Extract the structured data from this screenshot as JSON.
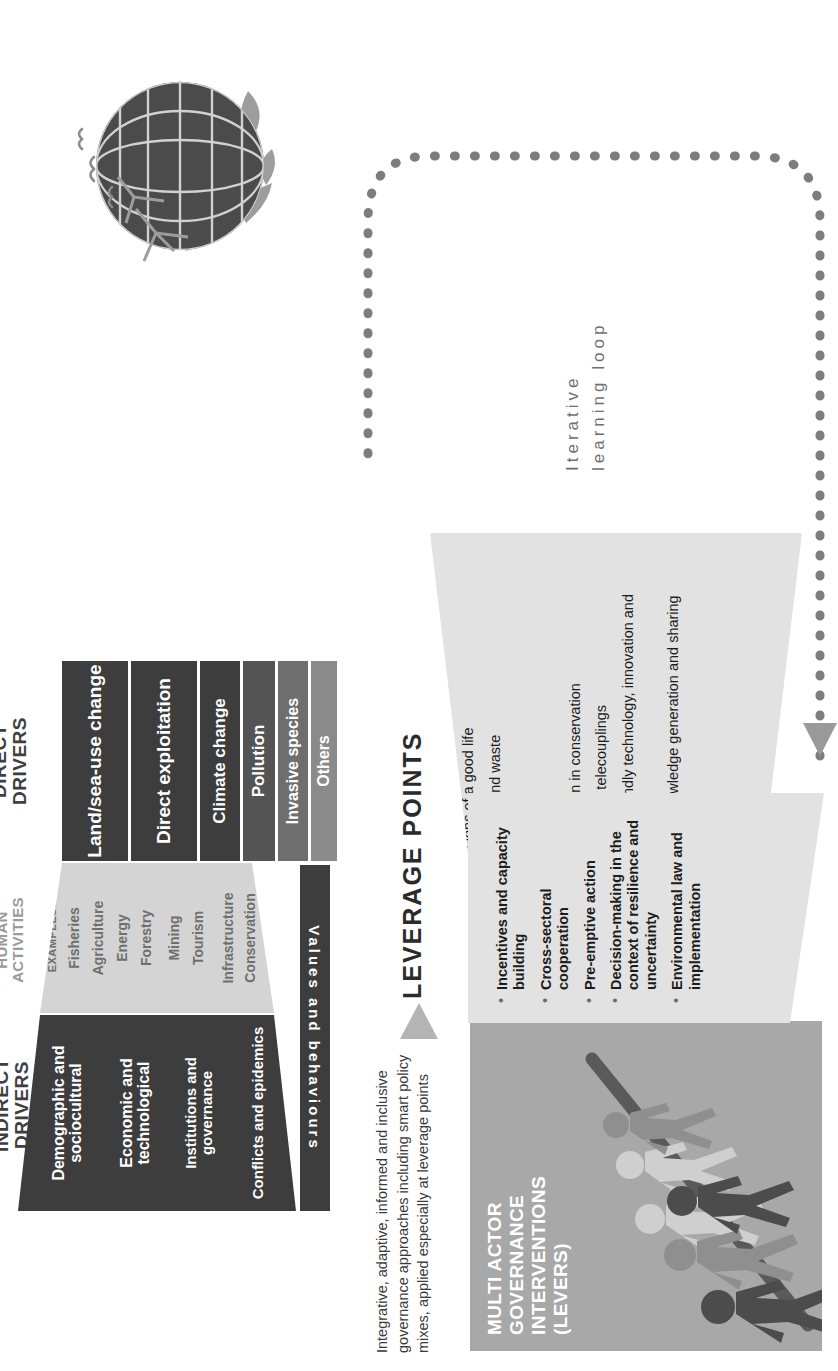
{
  "figure": {
    "title_hidden": "IPBES nature futures drivers and leverage points diagram"
  },
  "headers": {
    "indirect_drivers": "INDIRECT\nDRIVERS",
    "indirect_drivers_line1": "INDIRECT",
    "indirect_drivers_line2": "DRIVERS",
    "human_activities_line1": "HUMAN",
    "human_activities_line2": "ACTIVITIES",
    "direct_drivers_line1": "DIRECT",
    "direct_drivers_line2": "DRIVERS"
  },
  "indirect_drivers": [
    "Demographic and sociocultural",
    "Economic and technological",
    "Institutions and governance",
    "Conflicts and epidemics"
  ],
  "human_activities": {
    "label": "EXAMPLES:",
    "items": [
      "Fisheries",
      "Agriculture",
      "Energy",
      "Forestry",
      "Mining",
      "Tourism",
      "Infrastructure",
      "Conservation",
      "etc."
    ]
  },
  "direct_drivers": [
    "Land/sea-use change",
    "Direct exploitation",
    "Climate change",
    "Pollution",
    "Invasive species",
    "Others"
  ],
  "values_bar": "Values and behaviours",
  "leverage": {
    "title": "LEVERAGE POINTS",
    "points": [
      {
        "lead": "Embrace",
        "rest": " diverse visions of a good life"
      },
      {
        "lead": "Reduce",
        "rest": " total consumption and waste"
      },
      {
        "lead": "Unleash",
        "rest": " values and action"
      },
      {
        "lead": "Reduce",
        "rest": " inequalities"
      },
      {
        "lead": "Practice",
        "rest": " justice and inclusion in conservation"
      },
      {
        "lead": "Internalize",
        "rest": " externalities and telecouplings"
      },
      {
        "lead": "Ensure",
        "rest": " environmentally friendly technology, innovation and investment"
      },
      {
        "lead": "Promote",
        "rest": " education and knowledge generation and sharing"
      }
    ]
  },
  "levers": {
    "title_line1": "MULTI ACTOR",
    "title_line2": "GOVERNANCE INTERVENTIONS",
    "title_line3": "(LEVERS)",
    "items": [
      "Incentives and capacity building",
      "Cross-sectoral cooperation",
      "Pre-emptive action",
      "Decision-making in the context of resilience and uncertainty",
      "Environmental law and implementation"
    ]
  },
  "caption": "Integrative, adaptive, informed and inclusive governance approaches including smart policy mixes, applied especially at leverage points",
  "loop_label_line1": "Iterative",
  "loop_label_line2": "learning loop",
  "icons": {
    "globe": "globe-icon",
    "people": "people-silhouettes-icon",
    "loop": "dotted-loop-arrow-icon",
    "wedge_arrow": "triangle-arrow-icon"
  },
  "colors": {
    "dark_panel": "#3d3d3d",
    "mid_panel": "#d4d4d4",
    "grey_cell": "#7a7a7a",
    "leverage_panel": "#e2e2e2",
    "levers_panel": "#a8a8a8",
    "loop_dots": "#7d7d7d",
    "header_dark": "#3f3f3f",
    "header_light": "#9a9a9a"
  }
}
